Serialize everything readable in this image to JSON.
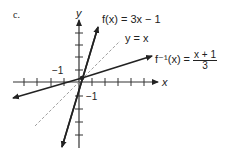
{
  "figure": {
    "part_label": "c.",
    "axes": {
      "x_label": "x",
      "y_label": "y",
      "tick_label_x": "−1",
      "tick_label_y": "−1"
    },
    "curves": [
      {
        "name": "f",
        "label_lhs": "f(x) = 3x − 1",
        "equation": "3x - 1"
      },
      {
        "name": "identity",
        "label_lhs": "y = x",
        "equation": "x"
      },
      {
        "name": "f_inverse",
        "label_lhs": "f⁻¹(x) =",
        "num": "x + 1",
        "den": "3",
        "equation": "(x + 1)/3"
      }
    ]
  }
}
